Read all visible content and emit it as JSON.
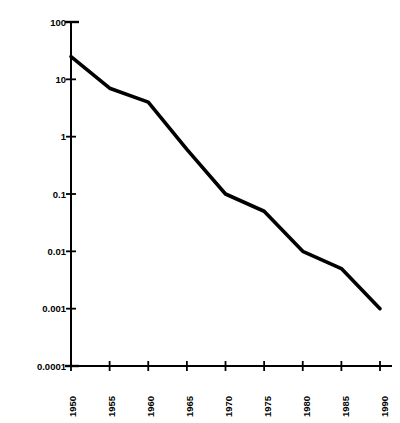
{
  "chart_data": {
    "type": "line",
    "title": "",
    "xlabel": "",
    "ylabel": "Relative cost per computation",
    "yscale": "log",
    "ylim": [
      0.0001,
      100
    ],
    "xlim": [
      1950,
      1990
    ],
    "grid": false,
    "legend": false,
    "axis_color": "#000000",
    "line_color": "#000000",
    "background_color": "#ffffff",
    "ytick_labels": [
      "100",
      "10",
      "1",
      "0.1",
      "0.01",
      "0.001",
      "0.0001"
    ],
    "ytick_values": [
      100,
      10,
      1,
      0.1,
      0.01,
      0.001,
      0.0001
    ],
    "xtick_labels": [
      "1950",
      "1955",
      "1960",
      "1965",
      "1970",
      "1975",
      "1980",
      "1985",
      "1990"
    ],
    "xtick_values": [
      1950,
      1955,
      1960,
      1965,
      1970,
      1975,
      1980,
      1985,
      1990
    ],
    "x": [
      1950,
      1955,
      1960,
      1965,
      1970,
      1975,
      1980,
      1985,
      1990
    ],
    "values": [
      25,
      7,
      4,
      0.6,
      0.1,
      0.05,
      0.01,
      0.005,
      0.001
    ],
    "series": [
      {
        "name": "Relative cost per computation",
        "x": [
          1950,
          1955,
          1960,
          1965,
          1970,
          1975,
          1980,
          1985,
          1990
        ],
        "values": [
          25,
          7,
          4,
          0.6,
          0.1,
          0.05,
          0.01,
          0.005,
          0.001
        ]
      }
    ]
  }
}
